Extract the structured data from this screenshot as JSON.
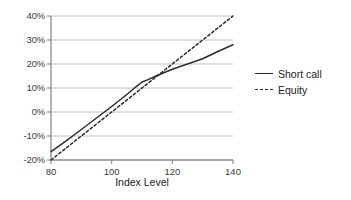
{
  "chart_data": {
    "type": "line",
    "title": "",
    "xlabel": "Index Level",
    "ylabel": "",
    "xlim": [
      80,
      140
    ],
    "ylim": [
      -0.2,
      0.4
    ],
    "xticks": [
      80,
      100,
      120,
      140
    ],
    "xtick_labels": [
      "80",
      "100",
      "120",
      "140"
    ],
    "yticks": [
      -0.2,
      -0.1,
      0.0,
      0.1,
      0.2,
      0.3,
      0.4
    ],
    "ytick_labels": [
      "-20%",
      "-10%",
      "0%",
      "10%",
      "20%",
      "30%",
      "40%"
    ],
    "grid": true,
    "legend_position": "right",
    "series": [
      {
        "name": "Short call",
        "style": "solid",
        "color": "#2b2b2b",
        "x": [
          80,
          85,
          90,
          95,
          100,
          105,
          108,
          110,
          112,
          115,
          120,
          125,
          130,
          135,
          140
        ],
        "y": [
          -0.165,
          -0.12,
          -0.073,
          -0.025,
          0.023,
          0.073,
          0.105,
          0.125,
          0.135,
          0.152,
          0.178,
          0.2,
          0.222,
          0.252,
          0.28
        ]
      },
      {
        "name": "Equity",
        "style": "dotted",
        "color": "#2b2b2b",
        "x": [
          80,
          140
        ],
        "y": [
          -0.2,
          0.4
        ]
      }
    ]
  },
  "legend": {
    "items": [
      {
        "label": "Short call",
        "style": "solid"
      },
      {
        "label": "Equity",
        "style": "dotted"
      }
    ]
  },
  "axis_title": {
    "x": "Index Level"
  },
  "colors": {
    "line": "#2b2b2b",
    "grid": "#b9b9b9",
    "axis": "#8a8a8a",
    "text": "#3a3a3a"
  }
}
